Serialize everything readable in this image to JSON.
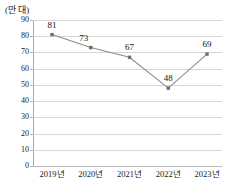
{
  "chart_data": {
    "type": "line",
    "title": "",
    "subtitle": "",
    "unit_label": "(만 대)",
    "xlabel": "",
    "ylabel": "",
    "categories": [
      "2019년",
      "2020년",
      "2021년",
      "2022년",
      "2023년"
    ],
    "values": [
      81,
      73,
      67,
      48,
      69
    ],
    "series": [
      {
        "name": "",
        "values": [
          81,
          73,
          67,
          48,
          69
        ]
      }
    ],
    "point_labels": [
      "81",
      "73",
      "67",
      "48",
      "69"
    ],
    "ylim": [
      0,
      90
    ],
    "ytick_step": 10,
    "ytick_labels": [
      "90",
      "80",
      "70",
      "60",
      "50",
      "40",
      "30",
      "20",
      "10",
      "0"
    ],
    "ytick_values": [
      90,
      80,
      70,
      60,
      50,
      40,
      30,
      20,
      10,
      0
    ],
    "grid": true,
    "grid_axis": "y",
    "legend": false,
    "legend_position": "none",
    "marker": "square",
    "colors": {
      "line": "#8c8c8c",
      "marker": "#6e6e6e",
      "grid": "#d6d6d6",
      "axis": "#a8a8a8",
      "text": "#1a1a1a",
      "background": "#ffffff"
    }
  }
}
